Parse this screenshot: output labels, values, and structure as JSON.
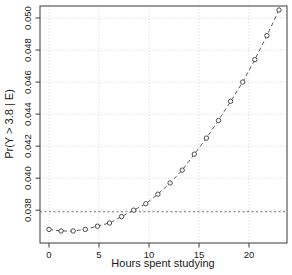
{
  "figure": {
    "background_color": "#ffffff",
    "axis_color": "#3a3a3a",
    "text_color": "#1a1a1a"
  },
  "chart_data": {
    "type": "line",
    "title": "",
    "xlabel": "Hours spent studying",
    "ylabel": "Pr(Y > 3.8 | E)",
    "x": [
      0,
      1.21,
      2.42,
      3.63,
      4.84,
      6.05,
      7.26,
      8.47,
      9.68,
      10.89,
      12.11,
      13.32,
      14.53,
      15.74,
      16.95,
      18.16,
      19.37,
      20.58,
      21.79,
      23
    ],
    "y": [
      0.0368,
      0.0367,
      0.0367,
      0.0368,
      0.037,
      0.0372,
      0.0376,
      0.038,
      0.0384,
      0.039,
      0.0397,
      0.0405,
      0.0415,
      0.0425,
      0.0436,
      0.0448,
      0.046,
      0.0474,
      0.0489,
      0.0505
    ],
    "x_ticks": [
      0,
      5,
      10,
      15,
      20
    ],
    "x_tick_labels": [
      "0",
      "5",
      "10",
      "15",
      "20"
    ],
    "y_ticks": [
      0.038,
      0.04,
      0.042,
      0.044,
      0.046,
      0.048,
      0.05
    ],
    "y_tick_labels": [
      "0.038",
      "0.040",
      "0.042",
      "0.044",
      "0.046",
      "0.048",
      "0.050"
    ],
    "xlim": [
      -0.9,
      23.8
    ],
    "ylim": [
      0.03595,
      0.05075
    ],
    "reference_line_y": 0.0379,
    "grid": true,
    "legend": null,
    "marker": "open-circle",
    "line_style": "dashed",
    "colors": {
      "series_line": "#5a5a5a",
      "point_stroke": "#4a4a4a",
      "point_fill": "#ffffff",
      "grid_line": "#c8c8c8",
      "reference_line": "#4a4a4a",
      "axis_box": "#3a3a3a"
    }
  }
}
